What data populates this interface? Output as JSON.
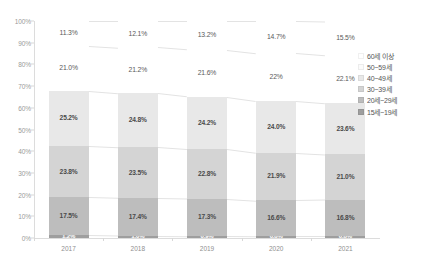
{
  "chart_data": {
    "type": "bar",
    "subtype": "100%-stacked-column",
    "title": "",
    "subtitle": "",
    "xlabel": "",
    "ylabel": "",
    "categories": [
      "2017",
      "2018",
      "2019",
      "2020",
      "2021"
    ],
    "ylim": [
      0,
      100
    ],
    "y_ticks": [
      "0%",
      "10%",
      "20%",
      "30%",
      "40%",
      "50%",
      "60%",
      "70%",
      "80%",
      "90%",
      "100%"
    ],
    "y_tick_values": [
      0,
      10,
      20,
      30,
      40,
      50,
      60,
      70,
      80,
      90,
      100
    ],
    "grid": false,
    "legend_position": "right",
    "series": [
      {
        "name": "15세~19세",
        "color": "#9e9e9e",
        "filled": true,
        "values": [
          1.2,
          1.0,
          0.9,
          0.8,
          0.8
        ],
        "labels": [
          "1.2%",
          "1.0%",
          "0.9%",
          "0.8%",
          "0.8%"
        ]
      },
      {
        "name": "20세~29세",
        "color": "#bdbdbd",
        "filled": true,
        "values": [
          17.5,
          17.4,
          17.3,
          16.6,
          16.8
        ],
        "labels": [
          "17.5%",
          "17.4%",
          "17.3%",
          "16.6%",
          "16.8%"
        ]
      },
      {
        "name": "30~39세",
        "color": "#d4d4d4",
        "filled": true,
        "values": [
          23.8,
          23.5,
          22.8,
          21.9,
          21.0
        ],
        "labels": [
          "23.8%",
          "23.5%",
          "22.8%",
          "21.9%",
          "21.0%"
        ]
      },
      {
        "name": "40~49세",
        "color": "#e8e8e8",
        "filled": true,
        "values": [
          25.2,
          24.8,
          24.2,
          24.0,
          23.6
        ],
        "labels": [
          "25.2%",
          "24.8%",
          "24.2%",
          "24.0%",
          "23.6%"
        ]
      },
      {
        "name": "50~59세",
        "color": "#f7f7f7",
        "filled": false,
        "values": [
          21.0,
          21.2,
          21.6,
          22.0,
          22.1
        ],
        "labels": [
          "21.0%",
          "21.2%",
          "21.6%",
          "22%",
          "22.1%"
        ]
      },
      {
        "name": "60세 이상",
        "color": "#ffffff",
        "filled": false,
        "values": [
          11.3,
          12.1,
          13.2,
          14.7,
          15.5
        ],
        "labels": [
          "11.3%",
          "12.1%",
          "13.2%",
          "14.7%",
          "15.5%"
        ]
      }
    ],
    "legend_entries": [
      {
        "label": "60세 이상",
        "color": "#ffffff"
      },
      {
        "label": "50~59세",
        "color": "#fbfbfb"
      },
      {
        "label": "40~49세",
        "color": "#e8e8e8"
      },
      {
        "label": "30~39세",
        "color": "#d4d4d4"
      },
      {
        "label": "20세~29세",
        "color": "#bdbdbd"
      },
      {
        "label": "15세~19세",
        "color": "#9e9e9e"
      }
    ]
  }
}
